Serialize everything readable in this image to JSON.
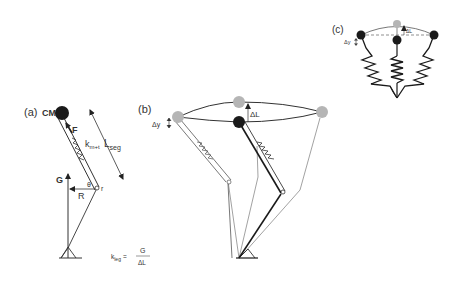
{
  "figure": {
    "panel_a": {
      "label": "(a)",
      "cm_label": "CM",
      "force_label": "F",
      "spring_label_base": "k",
      "spring_label_sub": "m+t",
      "segment_length_base": "L",
      "segment_length_sub": "seg",
      "ground_force_label": "G",
      "moment_arm_label": "R",
      "angle_label": "θ",
      "joint_radius_label": "r",
      "equation": {
        "lhs_base": "k",
        "lhs_sub": "leg",
        "equals": "=",
        "numerator": "G",
        "denominator": "ΔL"
      }
    },
    "panel_b": {
      "label": "(b)",
      "dy_label": "Δy",
      "dl_label": "ΔL"
    },
    "panel_c": {
      "label": "(c)",
      "dy_label": "Δy",
      "dl_label": "ΔL"
    },
    "colors": {
      "ink": "#1a1a1a",
      "gray_mass": "#b5b5b5",
      "gray_line": "#8a8a8a",
      "background": "#ffffff"
    }
  }
}
